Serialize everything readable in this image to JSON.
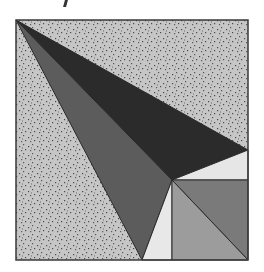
{
  "canvas": {
    "width": 264,
    "height": 272,
    "background": "#ffffff"
  },
  "figure": {
    "frame": {
      "x": 16,
      "y": 20,
      "width": 232,
      "height": 240,
      "stroke": "#3a3a3a"
    },
    "stipple": {
      "base": "#c6c6c6",
      "dot": "#4a4a4a"
    },
    "regions": [
      {
        "name": "black-triangle",
        "points": "16,20 248,150 172,180",
        "fill": "#2b2b2b"
      },
      {
        "name": "dark-gray-triangle",
        "points": "16,20 172,180 142,260",
        "fill": "#5c5c5c"
      },
      {
        "name": "white-strip-right",
        "points": "248,150 248,180 172,180",
        "fill": "#e6e6e6"
      },
      {
        "name": "white-triangle-bottom",
        "points": "172,180 172,260 142,260",
        "fill": "#e8e8e8"
      },
      {
        "name": "square-upper-right",
        "points": "172,180 248,180 248,260",
        "fill": "#7a7a7a"
      },
      {
        "name": "square-lower-left",
        "points": "172,180 172,260 248,260",
        "fill": "#9c9c9c"
      }
    ]
  }
}
